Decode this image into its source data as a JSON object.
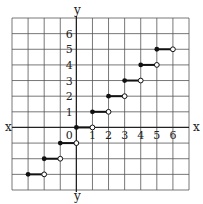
{
  "chart_data": {
    "type": "line",
    "title": "",
    "xlabel": "x",
    "ylabel": "y",
    "function": "greatest integer (floor) step function y = [[x]]",
    "xlim": [
      -4,
      7
    ],
    "ylim": [
      -4,
      7
    ],
    "grid": true,
    "x_ticks": [
      "0",
      "1",
      "2",
      "3",
      "4",
      "5",
      "6"
    ],
    "y_ticks": [
      "1",
      "2",
      "3",
      "4",
      "5",
      "6"
    ],
    "segments": [
      {
        "x_start": -3,
        "x_end": -2,
        "y": -3,
        "closed_start": true,
        "open_end": true
      },
      {
        "x_start": -2,
        "x_end": -1,
        "y": -2,
        "closed_start": true,
        "open_end": true
      },
      {
        "x_start": -1,
        "x_end": 0,
        "y": -1,
        "closed_start": true,
        "open_end": true
      },
      {
        "x_start": 0,
        "x_end": 1,
        "y": 0,
        "closed_start": true,
        "open_end": true
      },
      {
        "x_start": 1,
        "x_end": 2,
        "y": 1,
        "closed_start": true,
        "open_end": true
      },
      {
        "x_start": 2,
        "x_end": 3,
        "y": 2,
        "closed_start": true,
        "open_end": true
      },
      {
        "x_start": 3,
        "x_end": 4,
        "y": 3,
        "closed_start": true,
        "open_end": true
      },
      {
        "x_start": 4,
        "x_end": 5,
        "y": 4,
        "closed_start": true,
        "open_end": true
      },
      {
        "x_start": 5,
        "x_end": 6,
        "y": 5,
        "closed_start": true,
        "open_end": true
      }
    ],
    "colors": {
      "grid": "#555555",
      "axis": "#222222",
      "segment": "#111111",
      "background": "#ffffff"
    }
  },
  "labels": {
    "x_left": "x",
    "x_right": "x",
    "y_top": "y",
    "y_bottom": "y",
    "origin": "0"
  }
}
